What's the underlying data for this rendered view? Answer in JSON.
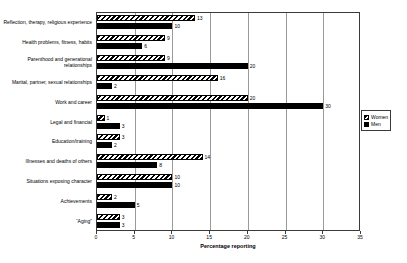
{
  "chart_data": {
    "type": "bar",
    "orientation": "horizontal",
    "title": "",
    "xlabel": "Percentage reporting",
    "ylabel": "",
    "xlim": [
      0,
      35
    ],
    "xticks": [
      0,
      5,
      10,
      15,
      20,
      25,
      30,
      35
    ],
    "grid": true,
    "grid_axis": "x",
    "legend_position": "right",
    "categories": [
      "Reflection, therapy, religious experience",
      "Health problems, fitness, habits",
      "Parenthood and generational relationships",
      "Marital, partner, sexual relationships",
      "Work and career",
      "Legal and financial",
      "Education/training",
      "Illnesses and deaths of others",
      "Situations exposing character",
      "Achievements",
      "“Aging”"
    ],
    "series": [
      {
        "name": "Women",
        "pattern": "diagonal-hatch",
        "values": [
          13,
          9,
          9,
          16,
          20,
          1,
          3,
          14,
          10,
          2,
          3
        ]
      },
      {
        "name": "Men",
        "pattern": "solid",
        "color": "#000000",
        "values": [
          10,
          6,
          20,
          2,
          30,
          3,
          2,
          8,
          10,
          5,
          3
        ]
      }
    ]
  },
  "legend": {
    "items": [
      {
        "label": "Women"
      },
      {
        "label": "Men"
      }
    ]
  }
}
